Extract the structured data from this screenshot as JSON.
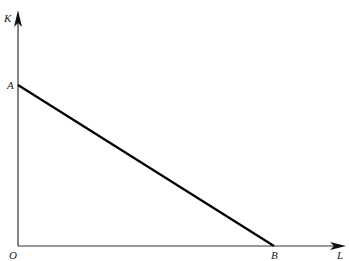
{
  "diagram": {
    "axes": {
      "y_label": "K",
      "x_label": "L",
      "origin_label": "O"
    },
    "points": {
      "A": "A",
      "B": "B"
    },
    "line": {
      "from": "A",
      "to": "B",
      "color": "#000000"
    }
  }
}
